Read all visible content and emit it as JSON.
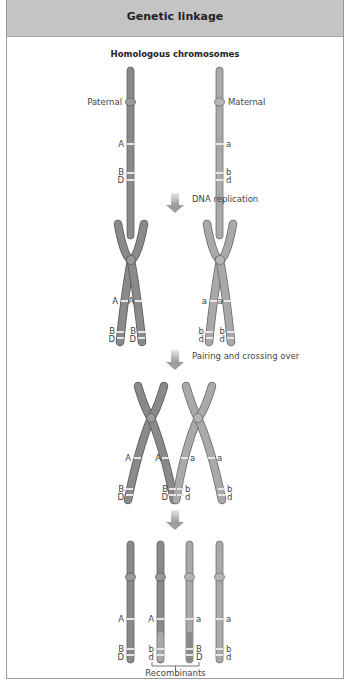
{
  "header": {
    "title": "Genetic linkage"
  },
  "section_title": "Homologous chromosomes",
  "labels": {
    "paternal": "Paternal",
    "maternal": "Maternal",
    "step1": "DNA replication",
    "step2": "Pairing and crossing over",
    "recombinants": "Recombinants"
  },
  "alleles": {
    "paternal": [
      "A",
      "B",
      "D"
    ],
    "maternal": [
      "a",
      "b",
      "d"
    ]
  },
  "final_chromosomes": [
    {
      "genes": [
        "A",
        "B",
        "D"
      ],
      "type": "parental"
    },
    {
      "genes": [
        "A",
        "b",
        "d"
      ],
      "type": "recombinant"
    },
    {
      "genes": [
        "a",
        "B",
        "D"
      ],
      "type": "recombinant"
    },
    {
      "genes": [
        "a",
        "b",
        "d"
      ],
      "type": "parental"
    }
  ],
  "colors": {
    "paternal": "#8a8a8a",
    "maternal": "#a9a9a9",
    "band": "#e6e6e6",
    "header_bg": "#c4c4c4",
    "arrow": "#b5b5b5"
  }
}
